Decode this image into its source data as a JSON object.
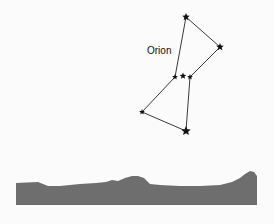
{
  "figure": {
    "title": "Orion",
    "colors": {
      "background": "#fbfbfb",
      "ink": "#111111",
      "landscape": "#6e6e6e"
    },
    "label": {
      "text": "Orion",
      "x": 147,
      "y": 54
    },
    "stars": [
      {
        "name": "top",
        "x": 186,
        "y": 17,
        "size": 4
      },
      {
        "name": "right-shoulder",
        "x": 220,
        "y": 47,
        "size": 4
      },
      {
        "name": "belt-left",
        "x": 175,
        "y": 77,
        "size": 3
      },
      {
        "name": "belt-middle",
        "x": 183,
        "y": 76,
        "size": 3.5
      },
      {
        "name": "belt-right",
        "x": 190,
        "y": 77,
        "size": 3
      },
      {
        "name": "left-foot",
        "x": 142,
        "y": 112,
        "size": 3
      },
      {
        "name": "bottom",
        "x": 186,
        "y": 131,
        "size": 5
      }
    ],
    "lines": [
      [
        186,
        17,
        175,
        77
      ],
      [
        186,
        17,
        220,
        47
      ],
      [
        220,
        47,
        190,
        77
      ],
      [
        175,
        77,
        142,
        112
      ],
      [
        190,
        77,
        186,
        131
      ],
      [
        142,
        112,
        186,
        131
      ]
    ],
    "landscape": {
      "bottom": 205,
      "outline": [
        [
          16,
          183
        ],
        [
          38,
          182
        ],
        [
          48,
          186
        ],
        [
          60,
          186
        ],
        [
          80,
          184
        ],
        [
          96,
          183
        ],
        [
          106,
          182
        ],
        [
          112,
          180
        ],
        [
          118,
          181
        ],
        [
          125,
          178
        ],
        [
          132,
          176
        ],
        [
          138,
          176
        ],
        [
          144,
          178
        ],
        [
          150,
          184
        ],
        [
          160,
          185
        ],
        [
          180,
          186
        ],
        [
          200,
          186
        ],
        [
          220,
          185
        ],
        [
          232,
          182
        ],
        [
          240,
          178
        ],
        [
          245,
          174
        ],
        [
          250,
          171
        ],
        [
          254,
          172
        ],
        [
          257,
          176
        ],
        [
          257,
          205
        ],
        [
          16,
          205
        ]
      ]
    }
  }
}
